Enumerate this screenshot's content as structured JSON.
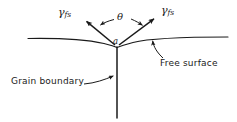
{
  "figure": {
    "background_color": "#ffffff",
    "line_color": "#1a1a1a",
    "text_color": "#1a1a1a",
    "width": 237,
    "height": 122
  },
  "labels": {
    "gamma_left": {
      "symbol": "γ",
      "subscript": "fs"
    },
    "gamma_right": {
      "symbol": "γ",
      "subscript": "fs"
    },
    "theta": "θ",
    "vertex": "a",
    "free_surface": "Free surface",
    "grain_boundary": "Grain boundary"
  },
  "icons": {
    "gamma_left_arrow": "arrow-up-left-icon",
    "gamma_right_arrow": "arrow-up-right-icon",
    "theta_arc_left_arrow": "curved-arrow-left-icon",
    "theta_arc_right_arrow": "curved-arrow-right-icon",
    "free_surface_leader": "curved-leader-arrow-up-icon",
    "grain_boundary_leader": "leader-arrow-right-icon"
  },
  "geometry": {
    "free_surface_curve": "M 28 38.5 C 60 38 88 40 104 43.5 C 110 45 114 46 117 47.5",
    "free_surface_curve_right": "M 117 47.5 C 121 46 126 44.5 133 42.5 C 152 37.5 190 37 228 37",
    "grain_boundary_line": {
      "x1": 117,
      "y1": 47,
      "x2": 117,
      "y2": 118
    },
    "gamma_left_vector": {
      "x1": 115,
      "y1": 45,
      "x2": 85.5,
      "y2": 20.5
    },
    "gamma_right_vector": {
      "x1": 119,
      "y1": 45,
      "x2": 155,
      "y2": 18
    },
    "theta_arc_left": "M 114 19.5 C 108 21 103.5 23 99.5 25.5",
    "theta_arc_right": "M 131 19 C 136 21 140 23.5 143.5 26",
    "free_surface_leader_path": "M 162 58 C 157 53 153.5 47 152.5 40",
    "grain_boundary_leader_path": "M 84 84 C 95 83 105 79.5 114.5 75.5"
  }
}
